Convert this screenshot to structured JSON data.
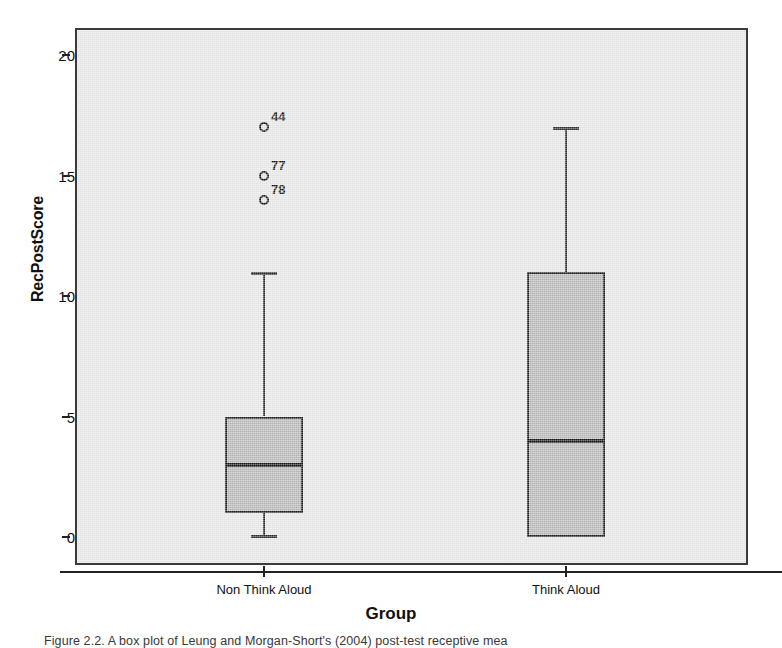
{
  "chart_data": {
    "type": "box",
    "title": "",
    "xlabel": "Group",
    "ylabel": "RecPostScore",
    "ylim": [
      -0.6,
      21.3
    ],
    "yticks": [
      0,
      5,
      10,
      15,
      20
    ],
    "ytick_labels": [
      "0",
      "5",
      "10",
      "15",
      "20"
    ],
    "categories": [
      "Non Think Aloud",
      "Think Aloud"
    ],
    "grid": false,
    "legend": "none",
    "boxes": [
      {
        "category": "Non Think Aloud",
        "whisker_low": 0,
        "q1": 1,
        "median": 3,
        "q3": 5,
        "whisker_high": 11,
        "outliers": [
          {
            "label": "44",
            "value": 17
          },
          {
            "label": "77",
            "value": 15
          },
          {
            "label": "78",
            "value": 14
          }
        ]
      },
      {
        "category": "Think Aloud",
        "whisker_low": 0,
        "q1": 0,
        "median": 4,
        "q3": 11,
        "whisker_high": 17,
        "outliers": []
      }
    ]
  },
  "axes": {
    "y_title": "RecPostScore",
    "x_title": "Group",
    "y_tick_labels": [
      "20",
      "15",
      "10",
      "5",
      "0"
    ],
    "x_tick_labels": [
      "Non Think Aloud",
      "Think Aloud"
    ]
  },
  "caption": {
    "text": "Figure 2.2. A box plot of Leung and Morgan-Short's (2004) post-test receptive mea"
  },
  "colors": {
    "plot_background": "#e7e7e7",
    "box_fill": "#b6b6b6",
    "stroke": "#1d1d1d",
    "page_background": "#ffffff"
  }
}
